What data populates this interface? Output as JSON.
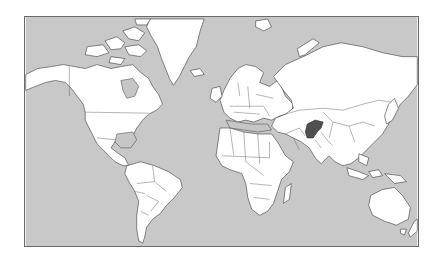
{
  "map": {
    "projection": "mercator",
    "colors": {
      "ocean": "#c8c8c8",
      "land": "#ffffff",
      "border": "#3a3a3a",
      "highlight": "#505050"
    },
    "highlighted_country": "Afghanistan",
    "icons": {
      "highlight_marker": "filled-region"
    }
  }
}
